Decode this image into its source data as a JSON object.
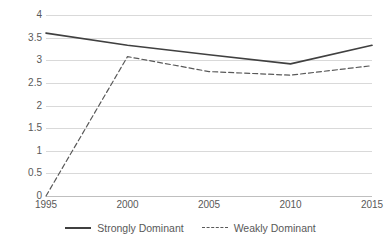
{
  "chart_data": {
    "type": "line",
    "title": "",
    "xlabel": "",
    "ylabel": "",
    "x": [
      1995,
      2000,
      2005,
      2010,
      2015
    ],
    "categories": [
      "1995",
      "2000",
      "2005",
      "2010",
      "2015"
    ],
    "xlim": [
      1995,
      2015
    ],
    "ylim": [
      0,
      4
    ],
    "ytick_values": [
      0,
      0.5,
      1,
      1.5,
      2,
      2.5,
      3,
      3.5,
      4
    ],
    "ytick_labels": [
      "0",
      "0.5",
      "1",
      "1.5",
      "2",
      "2.5",
      "3",
      "3.5",
      "4"
    ],
    "grid": "horizontal",
    "legend_position": "bottom",
    "series": [
      {
        "name": "Strongly Dominant",
        "style": "solid",
        "color": "#404040",
        "values": [
          3.6,
          3.33,
          3.12,
          2.92,
          3.33
        ]
      },
      {
        "name": "Weakly Dominant",
        "style": "dashed",
        "color": "#595959",
        "values": [
          0,
          3.08,
          2.75,
          2.67,
          2.88
        ]
      }
    ]
  },
  "legend": {
    "items": [
      {
        "label": "Strongly Dominant"
      },
      {
        "label": "Weakly Dominant"
      }
    ]
  }
}
